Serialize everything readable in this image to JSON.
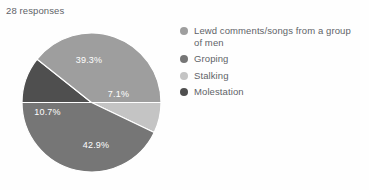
{
  "summary": {
    "responses_text": "28 responses"
  },
  "chart_data": {
    "type": "pie",
    "title": "",
    "subtitle": "28 responses",
    "total_responses": 28,
    "legend_position": "right",
    "start_angle_deg": 0,
    "direction": "clockwise",
    "categories": [
      "Lewd comments/songs from a group of men",
      "Groping",
      "Stalking",
      "Molestation"
    ],
    "values": [
      39.3,
      42.9,
      7.1,
      10.7
    ],
    "value_labels": [
      "39.3%",
      "42.9%",
      "7.1%",
      "10.7%"
    ],
    "colors": [
      "#9e9e9e",
      "#767676",
      "#c4c4c4",
      "#4f4f4f"
    ],
    "slices": [
      {
        "name": "Stalking",
        "percent": 7.1,
        "label": "7.1%",
        "color": "#c4c4c4",
        "start_deg": 0,
        "sweep_deg": 25.56,
        "label_x": 96.5,
        "label_y": 61.5
      },
      {
        "name": "Groping",
        "percent": 42.9,
        "label": "42.9%",
        "color": "#767676",
        "start_deg": 25.56,
        "sweep_deg": 154.44,
        "label_x": 74.0,
        "label_y": 113.0
      },
      {
        "name": "Molestation",
        "percent": 10.7,
        "label": "10.7%",
        "color": "#4f4f4f",
        "start_deg": 180.0,
        "sweep_deg": 38.52,
        "label_x": 25.5,
        "label_y": 80.0
      },
      {
        "name": "Lewd comments/songs from a group of men",
        "percent": 39.3,
        "label": "39.3%",
        "color": "#9e9e9e",
        "start_deg": 218.52,
        "sweep_deg": 141.48,
        "label_x": 67.0,
        "label_y": 28.0
      }
    ]
  },
  "legend": {
    "items": [
      {
        "label": "Lewd comments/songs from a group of men",
        "color": "#9e9e9e"
      },
      {
        "label": "Groping",
        "color": "#767676"
      },
      {
        "label": "Stalking",
        "color": "#c4c4c4"
      },
      {
        "label": "Molestation",
        "color": "#4f4f4f"
      }
    ]
  }
}
